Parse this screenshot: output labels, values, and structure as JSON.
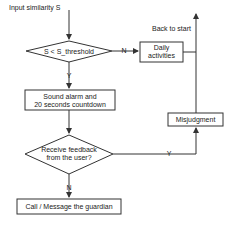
{
  "diagram": {
    "type": "flowchart",
    "input_label": "Input similarity S",
    "back_label": "Back to start",
    "nodes": {
      "decision1": "S < S_threshold",
      "daily1": "Daily",
      "daily2": "activities",
      "alarm1": "Sound alarm and",
      "alarm2": "20 seconds countdown",
      "decision2_1": "Receive feedback",
      "decision2_2": "from the user?",
      "misjudgment": "Misjudgment",
      "call": "Call / Message the guardian"
    },
    "edge_labels": {
      "d1_no": "N",
      "d1_yes": "Y",
      "d2_yes": "Y",
      "d2_no": "N"
    },
    "colors": {
      "line": "#333333",
      "fill": "#ffffff"
    }
  }
}
